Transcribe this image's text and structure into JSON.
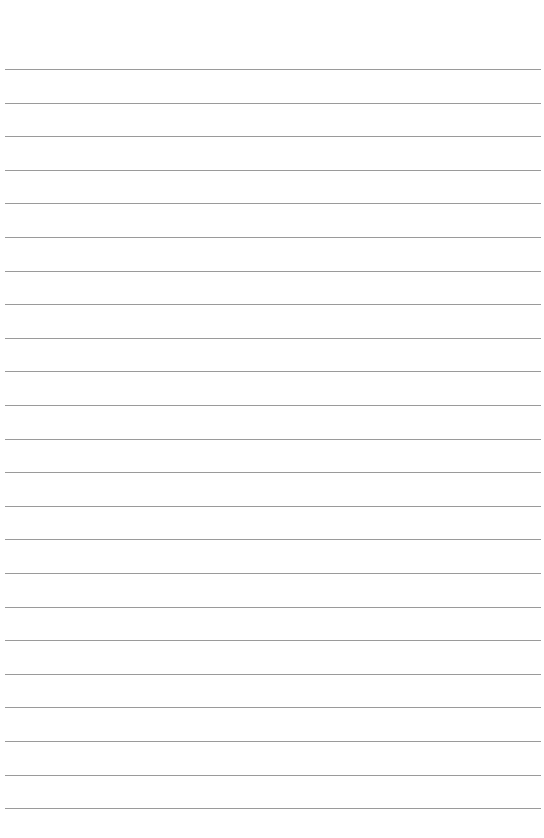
{
  "page": {
    "type": "lined-paper",
    "background": "#ffffff",
    "line_color": "#9a9a9a",
    "line_count": 23,
    "first_line_y": 69,
    "line_spacing": 33.6,
    "line_left": 5,
    "line_width": 536
  }
}
